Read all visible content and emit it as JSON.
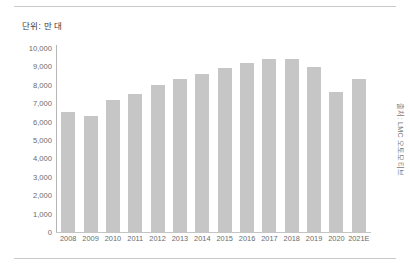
{
  "figure": {
    "unit_caption": "단위: 만 대",
    "source_note": "출처: LMC 오토모티브",
    "bar_color": "#c6c6c6",
    "axis_color": "#b6b6b6",
    "text_color": "#6b6b6b"
  },
  "chart_data": {
    "type": "bar",
    "title": "",
    "subtitle": "",
    "xlabel": "",
    "ylabel": "단위: 만 대",
    "ylim": [
      0,
      10000
    ],
    "ytick_step": 1000,
    "grid": false,
    "legend": null,
    "annotations": [
      "출처: LMC 오토모티브"
    ],
    "ytick_labels": [
      "10,000",
      "9,000",
      "8,000",
      "7,000",
      "6,000",
      "5,000",
      "4,000",
      "3,000",
      "2,000",
      "1,000",
      "0"
    ],
    "ytick_values": [
      10000,
      9000,
      8000,
      7000,
      6000,
      5000,
      4000,
      3000,
      2000,
      1000,
      0
    ],
    "categories": [
      "2008",
      "2009",
      "2010",
      "2011",
      "2012",
      "2013",
      "2014",
      "2015",
      "2016",
      "2017",
      "2018",
      "2019",
      "2020",
      "2021E"
    ],
    "values": [
      6500,
      6300,
      7200,
      7500,
      8000,
      8300,
      8600,
      8900,
      9200,
      9400,
      9400,
      8950,
      7600,
      8300
    ]
  }
}
